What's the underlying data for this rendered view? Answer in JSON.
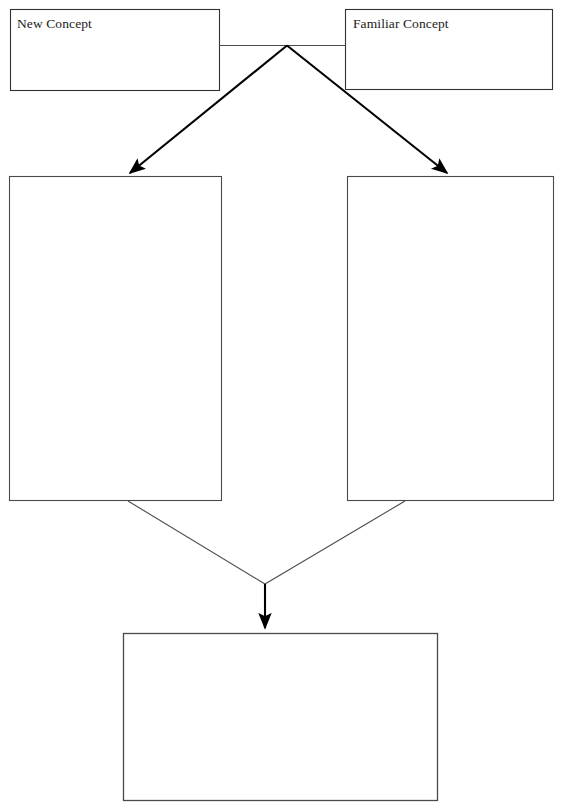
{
  "page": {
    "width": 566,
    "height": 812,
    "background_color": "#ffffff",
    "stroke_color": "#333333",
    "arrow_color": "#000000",
    "text_color": "#1a1a1a"
  },
  "diagram": {
    "type": "concept-comparison-organizer",
    "boxes": [
      {
        "id": "new-concept",
        "label": "New Concept",
        "x": 10,
        "y": 9,
        "width": 210,
        "height": 82,
        "filled": false
      },
      {
        "id": "familiar-concept",
        "label": "Familiar Concept",
        "x": 345,
        "y": 9,
        "width": 208,
        "height": 81,
        "filled": false
      },
      {
        "id": "left-detail",
        "label": "",
        "x": 9,
        "y": 176,
        "width": 213,
        "height": 325,
        "filled": false
      },
      {
        "id": "right-detail",
        "label": "",
        "x": 347,
        "y": 176,
        "width": 207,
        "height": 325,
        "filled": false
      },
      {
        "id": "conclusion",
        "label": "",
        "x": 123,
        "y": 633,
        "width": 315,
        "height": 168,
        "filled": false
      }
    ],
    "connectors": [
      {
        "id": "top-bridge",
        "kind": "line",
        "arrowhead": false,
        "thin": true,
        "points": "220,45 345,45"
      },
      {
        "id": "apex-to-left-detail",
        "kind": "arrow",
        "arrowhead": true,
        "thin": false,
        "points": "287,45 127,176"
      },
      {
        "id": "apex-to-right-detail",
        "kind": "arrow",
        "arrowhead": true,
        "thin": false,
        "points": "287,45 450,176"
      },
      {
        "id": "left-detail-to-junction",
        "kind": "line",
        "arrowhead": false,
        "thin": true,
        "points": "128,501 265,584"
      },
      {
        "id": "right-detail-to-junction",
        "kind": "line",
        "arrowhead": false,
        "thin": true,
        "points": "405,501 265,584"
      },
      {
        "id": "junction-to-conclusion",
        "kind": "arrow",
        "arrowhead": true,
        "thin": false,
        "points": "265,584 265,632"
      }
    ],
    "apex_point": {
      "x": 287,
      "y": 45
    },
    "junction_point": {
      "x": 265,
      "y": 584
    }
  },
  "artifact": {
    "bottom_left_glyph": "‘"
  }
}
